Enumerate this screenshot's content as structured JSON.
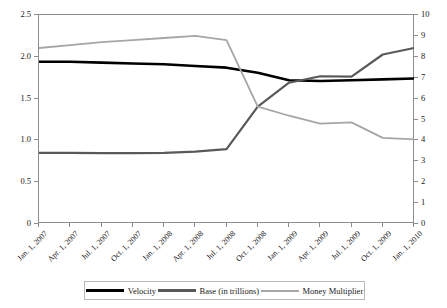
{
  "chart_data": {
    "type": "line",
    "title": "",
    "subtitle": "",
    "xlabel": "",
    "ylabel": "",
    "grid": false,
    "legend_position": "bottom",
    "x": [
      "Jan. 1, 2007",
      "Apr. 1, 2007",
      "Jul. 1, 2007",
      "Oct. 1, 2007",
      "Jan. 1, 2008",
      "Apr. 1, 2008",
      "Jul. 1, 2008",
      "Oct. 1, 2008",
      "Jan. 1, 2009",
      "Apr. 1, 2009",
      "Jul. 1, 2009",
      "Oct. 1, 2009",
      "Jan. 1, 2010"
    ],
    "categories": [
      "Jan. 1, 2007",
      "Apr. 1, 2007",
      "Jul. 1, 2007",
      "Oct. 1, 2007",
      "Jan. 1, 2008",
      "Apr. 1, 2008",
      "Jul. 1, 2008",
      "Oct. 1, 2008",
      "Jan. 1, 2009",
      "Apr. 1, 2009",
      "Jul. 1, 2009",
      "Oct. 1, 2009",
      "Jan. 1, 2010"
    ],
    "axes": {
      "left": {
        "label": "",
        "ylim": [
          0,
          2.5
        ],
        "ticks": [
          0,
          0.5,
          1.0,
          1.5,
          2.0,
          2.5
        ],
        "tick_labels": [
          "0",
          "0.5",
          "1.0",
          "1.5",
          "2.0",
          "2.5"
        ]
      },
      "right": {
        "label": "",
        "ylim": [
          0,
          10
        ],
        "ticks": [
          0,
          1,
          2,
          3,
          4,
          5,
          6,
          7,
          8,
          9,
          10
        ],
        "tick_labels": [
          "0",
          "1",
          "2",
          "3",
          "4",
          "5",
          "6",
          "7",
          "8",
          "9",
          "10"
        ]
      }
    },
    "series": [
      {
        "name": "Velocity",
        "axis": "left",
        "color": "#000000",
        "width": 2.6,
        "values": [
          1.94,
          1.94,
          1.93,
          1.92,
          1.91,
          1.89,
          1.87,
          1.81,
          1.72,
          1.71,
          1.72,
          1.73,
          1.74
        ]
      },
      {
        "name": "Base (in trillions)",
        "axis": "right",
        "color": "#595959",
        "width": 2.2,
        "values": [
          3.4,
          3.4,
          3.39,
          3.39,
          3.4,
          3.46,
          3.58,
          5.62,
          6.76,
          7.07,
          7.05,
          8.11,
          8.42
        ]
      },
      {
        "name": "Money Multiplier",
        "axis": "right",
        "color": "#a6a6a6",
        "width": 1.8,
        "values": [
          8.42,
          8.56,
          8.7,
          8.8,
          8.9,
          9.0,
          8.8,
          5.62,
          5.18,
          4.8,
          4.86,
          4.12,
          4.05
        ]
      }
    ]
  },
  "legend": {
    "items": [
      {
        "label": "Velocity"
      },
      {
        "label": "Base (in trillions)"
      },
      {
        "label": "Money Multiplier"
      }
    ]
  }
}
